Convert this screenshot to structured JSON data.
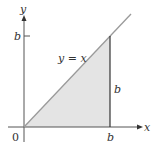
{
  "diagram": {
    "x_axis_label": "x",
    "y_axis_label": "y",
    "origin_label": "0",
    "line_label": "y = x",
    "y_tick_label": "b",
    "x_tick_label": "b",
    "side_label": "b",
    "colors": {
      "shade": "#e4e4e4",
      "line": "#9a9a9a",
      "axis": "#555555",
      "vertical": "#333333"
    }
  }
}
